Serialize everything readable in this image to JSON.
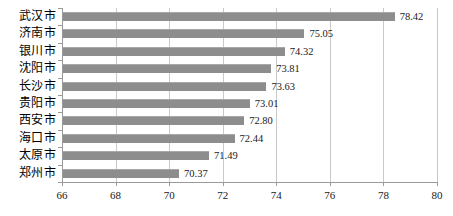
{
  "chart_data": {
    "type": "bar",
    "orientation": "horizontal",
    "title": "",
    "subtitle": "",
    "xlabel": "",
    "ylabel": "",
    "categories": [
      "武汉市",
      "济南市",
      "银川市",
      "沈阳市",
      "长沙市",
      "贵阳市",
      "西安市",
      "海口市",
      "太原市",
      "郑州市"
    ],
    "values": [
      78.42,
      75.05,
      74.32,
      73.81,
      73.63,
      73.01,
      72.8,
      72.44,
      71.49,
      70.37
    ],
    "value_labels": [
      "78.42",
      "75.05",
      "74.32",
      "73.81",
      "73.63",
      "73.01",
      "72.80",
      "72.44",
      "71.49",
      "70.37"
    ],
    "xlim": [
      66,
      80
    ],
    "xticks": [
      66,
      68,
      70,
      72,
      74,
      76,
      78,
      80
    ],
    "xtick_labels": [
      "66",
      "68",
      "70",
      "72",
      "74",
      "76",
      "78",
      "80"
    ],
    "grid": true,
    "grid_axis": "x",
    "legend": false,
    "legend_position": "none",
    "bar_color": "#8d8d8d",
    "gridline_color": "#c9c9c9",
    "axis_color": "#9a9a9a",
    "text_color": "#1a1a1a",
    "background_color": "#ffffff"
  }
}
